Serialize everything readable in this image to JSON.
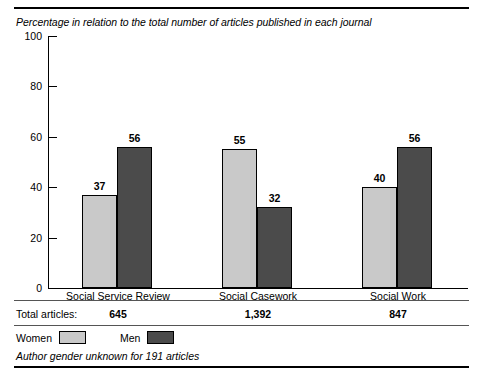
{
  "subtitle": "Percentage in relation to the total number of articles published in each journal",
  "totals_row": {
    "label": "Total articles:",
    "values": [
      "645",
      "1,392",
      "847"
    ]
  },
  "legend": {
    "items": [
      {
        "label": "Women",
        "swatch": "legend-swatch-women",
        "color": "#c9c9c9"
      },
      {
        "label": "Men",
        "swatch": "legend-swatch-men",
        "color": "#4b4b4b"
      }
    ]
  },
  "footnote": "Author gender unknown for 191 articles",
  "chart_data": {
    "type": "bar",
    "title": "",
    "subtitle": "Percentage in relation to the total number of articles published in each journal",
    "categories": [
      "Social Service Review",
      "Social Casework",
      "Social Work"
    ],
    "series": [
      {
        "name": "Women",
        "color": "#c9c9c9",
        "values": [
          37,
          55,
          40
        ]
      },
      {
        "name": "Men",
        "color": "#4b4b4b",
        "values": [
          56,
          32,
          56
        ]
      }
    ],
    "xlabel": "",
    "ylabel": "",
    "ylim": [
      0,
      100
    ],
    "yticks": [
      0,
      20,
      40,
      60,
      80,
      100
    ],
    "ytick_labels": [
      "0",
      "20",
      "40",
      "60",
      "80",
      "100"
    ],
    "grid": false,
    "legend_position": "bottom-left",
    "data_labels": true,
    "annotations": {
      "total_articles": {
        "Social Service Review": 645,
        "Social Casework": 1392,
        "Social Work": 847
      },
      "footnote": "Author gender unknown for 191 articles"
    }
  }
}
